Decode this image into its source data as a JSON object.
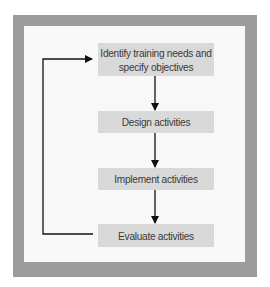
{
  "diagram": {
    "type": "flowchart",
    "colors": {
      "frame": "#9c9c9c",
      "background": "#f8f8f8",
      "box_fill": "#d9d9d9",
      "text": "#3a3a3a",
      "arrow": "#111111"
    },
    "steps": [
      {
        "id": "identify",
        "label_line1": "Identify training needs and",
        "label_line2": "specify objectives"
      },
      {
        "id": "design",
        "label": "Design activities"
      },
      {
        "id": "implement",
        "label": "Implement activities"
      },
      {
        "id": "evaluate",
        "label": "Evaluate activities"
      }
    ],
    "edges": [
      {
        "from": "identify",
        "to": "design"
      },
      {
        "from": "design",
        "to": "implement"
      },
      {
        "from": "implement",
        "to": "evaluate"
      },
      {
        "from": "evaluate",
        "to": "identify",
        "kind": "feedback-loop"
      }
    ]
  }
}
